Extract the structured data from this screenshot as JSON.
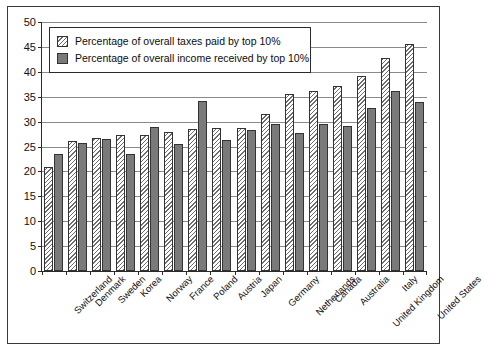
{
  "chart_data": {
    "type": "bar",
    "title": "",
    "subtitle": "",
    "xlabel": "",
    "ylabel": "",
    "ylim": [
      0,
      50
    ],
    "ytick_step": 5,
    "yticks": [
      0,
      5,
      10,
      15,
      20,
      25,
      30,
      35,
      40,
      45,
      50
    ],
    "grid": "horizontal",
    "legend_position": "top-left-inside",
    "categories": [
      "Switzerland",
      "Denmark",
      "Sweden",
      "Korea",
      "Norway",
      "France",
      "Poland",
      "Austria",
      "Japan",
      "Germany",
      "Netherlands",
      "Canada",
      "Australia",
      "United Kingdom",
      "Italy",
      "United States"
    ],
    "series": [
      {
        "name": "Percentage of overall taxes paid by top 10%",
        "style": "hatched",
        "color": "#ffffff",
        "values": [
          20.8,
          26.2,
          26.7,
          27.4,
          27.4,
          28.0,
          28.5,
          28.8,
          28.8,
          31.5,
          35.6,
          36.1,
          37.2,
          39.1,
          42.8,
          45.5
        ]
      },
      {
        "name": "Percentage of overall income received by top 10%",
        "style": "solid",
        "color": "#7a7a7a",
        "values": [
          23.5,
          25.7,
          26.6,
          23.4,
          29.0,
          25.6,
          34.2,
          26.3,
          28.3,
          29.5,
          27.8,
          29.5,
          29.2,
          32.8,
          36.2,
          33.9
        ]
      }
    ]
  },
  "legend": {
    "items": [
      {
        "label": "Percentage of overall taxes paid by top 10%",
        "swatch": "hatched-swatch"
      },
      {
        "label": "Percentage of overall income received by top 10%",
        "swatch": "solid-gray-swatch"
      }
    ]
  },
  "colors": {
    "axis": "#2b2b2b",
    "gridline": "#8a8a8a",
    "frame": "#3a3a3a",
    "hatch": "#6e6e6e",
    "solid_bar": "#7a7a7a",
    "background": "#ffffff",
    "text": "#111111"
  }
}
